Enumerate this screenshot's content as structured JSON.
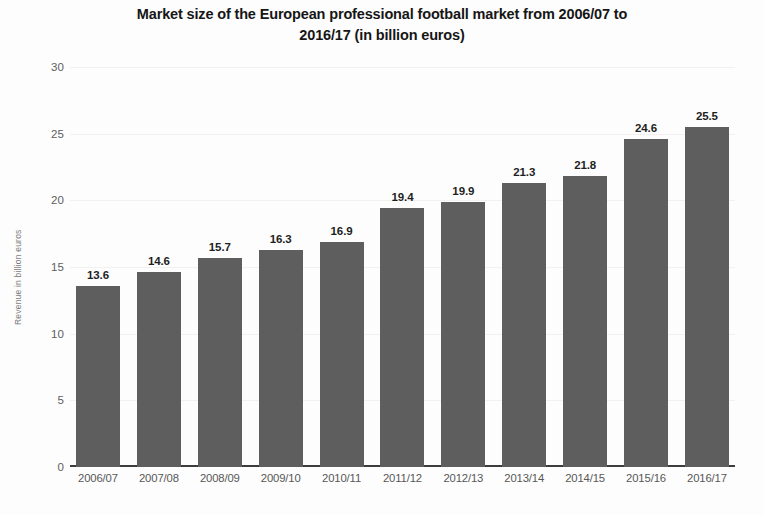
{
  "chart_data": {
    "type": "bar",
    "title": "Market size of the European professional football market from 2006/07 to\n2016/17 (in billion euros)",
    "xlabel": "",
    "ylabel": "Revenue in billion euros",
    "ylim": [
      0,
      30
    ],
    "ytick_values": [
      30,
      25,
      20,
      15,
      10,
      5,
      0
    ],
    "ytick_labels": [
      "30",
      "25",
      "20",
      "15",
      "10",
      "5",
      "0"
    ],
    "grid": true,
    "legend": null,
    "categories": [
      "2006/07",
      "2007/08",
      "2008/09",
      "2009/10",
      "2010/11",
      "2011/12",
      "2012/13",
      "2013/14",
      "2014/15",
      "2015/16",
      "2016/17"
    ],
    "values": [
      13.6,
      14.6,
      15.7,
      16.3,
      16.9,
      19.4,
      19.9,
      21.3,
      21.8,
      24.6,
      25.5
    ],
    "value_labels": [
      "13.6",
      "14.6",
      "15.7",
      "16.3",
      "16.9",
      "19.4",
      "19.9",
      "21.3",
      "21.8",
      "24.6",
      "25.5"
    ],
    "bar_color": "#5e5e5e",
    "text_color": "#1f1f1f",
    "axis_color": "#3d3d3d",
    "background_color": "#fdfdfd"
  }
}
